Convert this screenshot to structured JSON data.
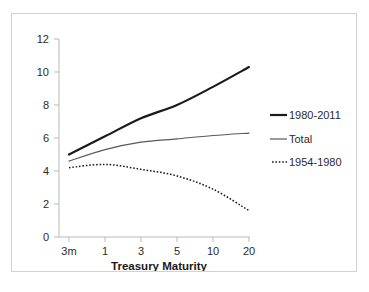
{
  "chart_data": {
    "type": "line",
    "title": "",
    "subtitle": "",
    "xlabel": "Treasury Maturity",
    "ylabel": "",
    "categories": [
      "3m",
      "1",
      "3",
      "5",
      "10",
      "20"
    ],
    "xtick_labels": [
      "3m",
      "1",
      "3",
      "5",
      "10",
      "20"
    ],
    "ytick_labels": [
      "0",
      "2",
      "4",
      "6",
      "8",
      "10",
      "12"
    ],
    "ylim": [
      0,
      12
    ],
    "ytick_step": 2,
    "grid": false,
    "legend_position": "right",
    "series": [
      {
        "name": "1980-2011",
        "style": "solid-thick",
        "color": "#1a1a1a",
        "values": [
          5.0,
          6.1,
          7.2,
          8.0,
          9.1,
          10.3
        ]
      },
      {
        "name": "Total",
        "style": "solid-thin",
        "color": "#595959",
        "values": [
          4.6,
          5.3,
          5.75,
          5.95,
          6.15,
          6.3
        ]
      },
      {
        "name": "1954-1980",
        "style": "dotted",
        "color": "#1a1a1a",
        "values": [
          4.2,
          4.4,
          4.1,
          3.7,
          2.9,
          1.6
        ]
      }
    ]
  },
  "axis": {
    "x_title": "Treasury Maturity",
    "y_ticks": [
      "12",
      "10",
      "8",
      "6",
      "4",
      "2",
      "0"
    ],
    "x_ticks": [
      "3m",
      "1",
      "3",
      "5",
      "10",
      "20"
    ]
  },
  "legend": {
    "items": [
      {
        "label": "1980-2011",
        "marker": "solid-thick-line-icon"
      },
      {
        "label": "Total",
        "marker": "solid-thin-line-icon"
      },
      {
        "label": "1954-1980",
        "marker": "dotted-line-icon"
      }
    ]
  },
  "colors": {
    "series_dark": "#1a1a1a",
    "series_gray": "#595959",
    "axis": "#b9b9b9",
    "frame": "#d2d2d2",
    "background": "#ffffff"
  }
}
